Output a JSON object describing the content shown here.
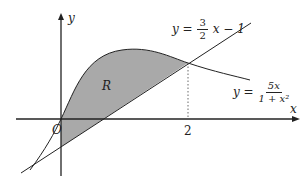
{
  "diagram": {
    "axes": {
      "x_label": "x",
      "y_label": "y",
      "origin_label": "O",
      "x_tick_label": "2"
    },
    "region_label": "R",
    "line_equation": {
      "lhs": "y =",
      "num": "3",
      "den": "2",
      "rest": "x − 1"
    },
    "curve_equation": {
      "lhs": "y =",
      "num": "5x",
      "den": "1 + x²"
    },
    "colors": {
      "shade": "#a9a9a9",
      "stroke": "#222222"
    }
  }
}
